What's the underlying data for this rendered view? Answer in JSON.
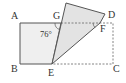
{
  "diagram": {
    "type": "folded-rectangle",
    "labels": {
      "A": "A",
      "B": "B",
      "C": "C",
      "D": "D",
      "E": "E",
      "F": "F",
      "G": "G"
    },
    "angle_label": "76°",
    "colors": {
      "stroke": "#555555",
      "fill": "#e6e6e6",
      "dashed": "#666666"
    }
  }
}
